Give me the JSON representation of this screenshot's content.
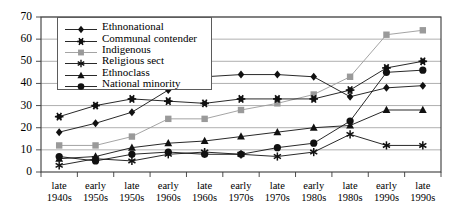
{
  "chart_data": {
    "type": "line",
    "title": "",
    "xlabel": "",
    "ylabel": "",
    "ylim": [
      0,
      70
    ],
    "ytick_step": 10,
    "yticks": [
      0,
      10,
      20,
      30,
      40,
      50,
      60,
      70
    ],
    "grid": "horizontal",
    "legend_position": "upper-left-inside",
    "categories": [
      "late 1940s",
      "early 1950s",
      "late 1950s",
      "early 1960s",
      "late 1960s",
      "early 1970s",
      "late 1970s",
      "early 1980s",
      "late 1980s",
      "early 1990s",
      "late 1990s"
    ],
    "categories_split": [
      [
        "late",
        "1940s"
      ],
      [
        "early",
        "1950s"
      ],
      [
        "late",
        "1950s"
      ],
      [
        "early",
        "1960s"
      ],
      [
        "late",
        "1960s"
      ],
      [
        "early",
        "1970s"
      ],
      [
        "late",
        "1970s"
      ],
      [
        "early",
        "1980s"
      ],
      [
        "late",
        "1980s"
      ],
      [
        "early",
        "1990s"
      ],
      [
        "late",
        "1990s"
      ]
    ],
    "series": [
      {
        "name": "Ethnonational",
        "marker": "diamond",
        "color": "#111111",
        "values": [
          18,
          22,
          27,
          37,
          43,
          44,
          44,
          43,
          34,
          38,
          39
        ]
      },
      {
        "name": "Communal contender",
        "marker": "star6",
        "color": "#111111",
        "values": [
          25,
          30,
          33,
          32,
          31,
          33,
          33,
          33,
          37,
          47,
          50
        ]
      },
      {
        "name": "Indigenous",
        "marker": "square",
        "color": "#9a9a9a",
        "values": [
          12,
          12,
          16,
          24,
          24,
          28,
          31,
          35,
          43,
          62,
          64
        ]
      },
      {
        "name": "Religious sect",
        "marker": "asterisk",
        "color": "#111111",
        "values": [
          3,
          6,
          5,
          8,
          9,
          8,
          7,
          9,
          17,
          12,
          12
        ]
      },
      {
        "name": "Ethnoclass",
        "marker": "triangle",
        "color": "#111111",
        "values": [
          6,
          7,
          11,
          13,
          14,
          16,
          18,
          20,
          21,
          28,
          28
        ]
      },
      {
        "name": "National minority",
        "marker": "circle",
        "color": "#111111",
        "values": [
          7,
          5,
          8,
          9,
          8,
          8,
          11,
          13,
          23,
          45,
          46
        ]
      }
    ]
  },
  "legend": {
    "items": [
      {
        "label": "Ethnonational"
      },
      {
        "label": "Communal contender"
      },
      {
        "label": "Indigenous"
      },
      {
        "label": "Religious sect"
      },
      {
        "label": "Ethnoclass"
      },
      {
        "label": "National minority"
      }
    ]
  }
}
